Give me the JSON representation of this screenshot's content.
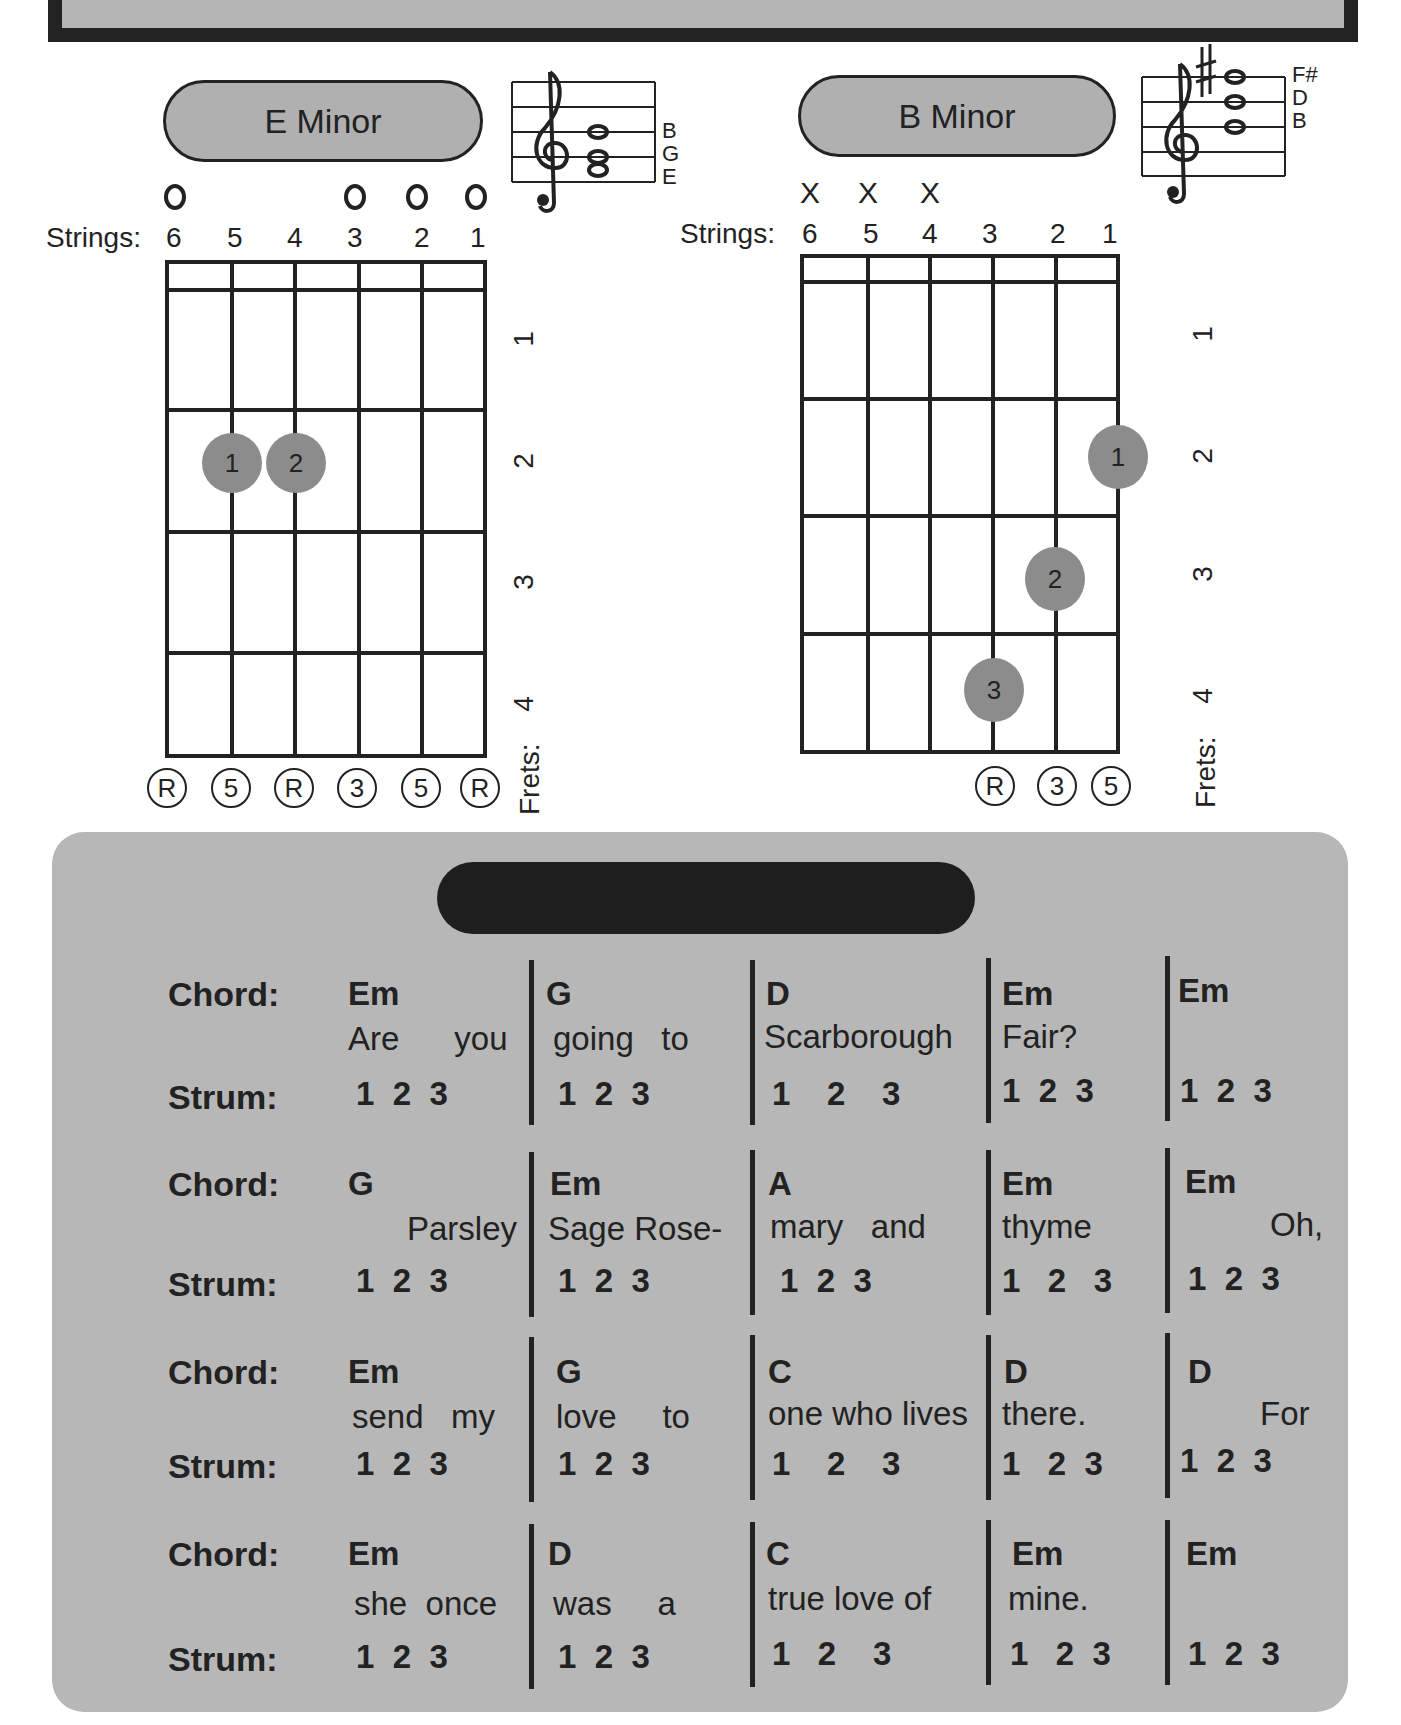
{
  "chords": [
    {
      "name": "E Minor",
      "staff_notes": [
        "B",
        "G",
        "E"
      ],
      "strings_label": "Strings:",
      "string_numbers": [
        "6",
        "5",
        "4",
        "3",
        "2",
        "1"
      ],
      "string_markers": [
        "O",
        "",
        "",
        "O",
        "O",
        "O"
      ],
      "fret_numbers": [
        "1",
        "2",
        "3",
        "4"
      ],
      "frets_label": "Frets:",
      "fingers": [
        {
          "finger": "1",
          "string": 5,
          "fret": 2
        },
        {
          "finger": "2",
          "string": 4,
          "fret": 2
        }
      ],
      "intervals": [
        "R",
        "5",
        "R",
        "3",
        "5",
        "R"
      ]
    },
    {
      "name": "B Minor",
      "staff_notes": [
        "F#",
        "D",
        "B"
      ],
      "strings_label": "Strings:",
      "string_numbers": [
        "6",
        "5",
        "4",
        "3",
        "2",
        "1"
      ],
      "string_markers": [
        "X",
        "X",
        "X",
        "",
        "",
        ""
      ],
      "fret_numbers": [
        "1",
        "2",
        "3",
        "4"
      ],
      "frets_label": "Frets:",
      "fingers": [
        {
          "finger": "1",
          "string": 1,
          "fret": 2
        },
        {
          "finger": "2",
          "string": 2,
          "fret": 3
        },
        {
          "finger": "3",
          "string": 3,
          "fret": 4
        }
      ],
      "intervals": [
        "",
        "",
        "",
        "R",
        "3",
        "5"
      ]
    }
  ],
  "song": {
    "chord_label": "Chord:",
    "strum_label": "Strum:",
    "lines": [
      {
        "measures": [
          {
            "chord": "Em",
            "lyric": "Are      you",
            "strum": "1  2  3"
          },
          {
            "chord": "G",
            "lyric": "going   to",
            "strum": "1  2  3"
          },
          {
            "chord": "D",
            "lyric": "Scarborough",
            "strum": "1    2    3"
          },
          {
            "chord": "Em",
            "lyric": "Fair?",
            "strum": "1  2  3"
          },
          {
            "chord": "Em",
            "lyric": "",
            "strum": "1  2  3"
          }
        ]
      },
      {
        "measures": [
          {
            "chord": "G",
            "lyric": "Parsley",
            "strum": "1  2  3"
          },
          {
            "chord": "Em",
            "lyric": "Sage Rose-",
            "strum": "1  2  3"
          },
          {
            "chord": "A",
            "lyric": "mary   and",
            "strum": "1  2  3"
          },
          {
            "chord": "Em",
            "lyric": "thyme",
            "strum": "1   2   3"
          },
          {
            "chord": "Em",
            "lyric": "Oh,",
            "strum": "1  2  3"
          }
        ]
      },
      {
        "measures": [
          {
            "chord": "Em",
            "lyric": "send   my",
            "strum": "1  2  3"
          },
          {
            "chord": "G",
            "lyric": "love     to",
            "strum": "1  2  3"
          },
          {
            "chord": "C",
            "lyric": "one who lives",
            "strum": "1    2    3"
          },
          {
            "chord": "D",
            "lyric": "there.",
            "strum": "1   2  3"
          },
          {
            "chord": "D",
            "lyric": "For",
            "strum": "1  2  3"
          }
        ]
      },
      {
        "measures": [
          {
            "chord": "Em",
            "lyric": "she  once",
            "strum": "1  2  3"
          },
          {
            "chord": "D",
            "lyric": "was     a",
            "strum": "1  2  3"
          },
          {
            "chord": "C",
            "lyric": "true love of",
            "strum": "1   2    3"
          },
          {
            "chord": "Em",
            "lyric": "mine.",
            "strum": "1   2  3"
          },
          {
            "chord": "Em",
            "lyric": "",
            "strum": "1  2  3"
          }
        ]
      }
    ]
  }
}
